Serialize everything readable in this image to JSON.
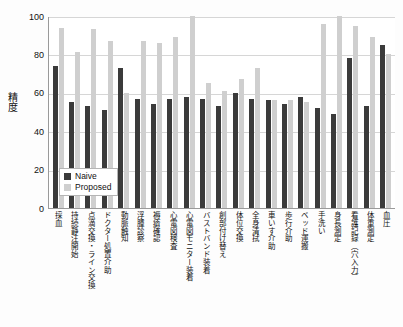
{
  "chart_data": {
    "type": "bar",
    "title": "",
    "xlabel": "",
    "ylabel": "精度",
    "ylim": [
      0,
      100
    ],
    "yticks": [
      0,
      20,
      40,
      60,
      80,
      100
    ],
    "grid": true,
    "legend_position": "inside-bottom-left",
    "categories": [
      "採血",
      "持続静注開始",
      "点滴交換・ライン交換",
      "ドクター処置介助",
      "動脈触知",
      "浮腫診察",
      "褥瘡確認",
      "心電図検査",
      "心電図モニター装着",
      "バストバンド装着",
      "創部付け替え",
      "体位交換",
      "全身清拭",
      "車いす介助",
      "歩行介助",
      "ベッド運搬",
      "手洗い",
      "身長測定",
      "看護記録（穴入力）",
      "体重測定",
      "血圧"
    ],
    "series": [
      {
        "name": "Naive",
        "color": "#3b3b3b",
        "values": [
          74,
          55,
          53,
          51,
          73,
          57,
          54,
          57,
          58,
          57,
          53,
          60,
          57,
          56,
          54,
          58,
          52,
          49,
          78,
          53,
          85
        ]
      },
      {
        "name": "Proposed",
        "color": "#cfcfcf",
        "values": [
          94,
          81,
          93,
          87,
          60,
          87,
          86,
          89,
          100,
          65,
          61,
          67,
          73,
          56,
          56,
          55,
          96,
          100,
          95,
          89,
          80
        ]
      }
    ]
  },
  "legend": {
    "entries": [
      {
        "label": "Naive",
        "color": "#3b3b3b"
      },
      {
        "label": "Proposed",
        "color": "#cfcfcf"
      }
    ]
  }
}
